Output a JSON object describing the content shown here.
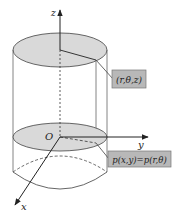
{
  "diagram": {
    "axes": {
      "z_label": "z",
      "y_label": "y",
      "x_label": "x",
      "origin_label": "O"
    },
    "callouts": {
      "point_label": "(r,θ,z)",
      "projection_label": "p(x,y)=p(r,θ)"
    },
    "colors": {
      "disk_fill": "#d9d9d9",
      "callout_fill": "#b8b8b8",
      "stroke": "#333333"
    }
  }
}
